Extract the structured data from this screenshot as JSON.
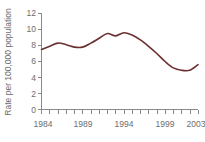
{
  "chart_data": {
    "type": "line",
    "title": "",
    "subtitle": "",
    "xlabel": "",
    "ylabel": "Rate per 100,000 population",
    "xlim": [
      1984,
      2003
    ],
    "ylim": [
      0,
      12
    ],
    "grid": false,
    "legend": false,
    "legend_position": "none",
    "line_color": "#6b3030",
    "axis_color": "#8a8a8a",
    "text_color": "#6d6d6d",
    "background_color": "#ffffff",
    "y_ticks": [
      0,
      2,
      4,
      6,
      8,
      10,
      12
    ],
    "y_tick_labels": [
      "0",
      "2",
      "4",
      "6",
      "8",
      "10",
      "12"
    ],
    "x_ticks": [
      1984,
      1985,
      1986,
      1987,
      1988,
      1989,
      1990,
      1991,
      1992,
      1993,
      1994,
      1995,
      1996,
      1997,
      1998,
      1999,
      2000,
      2001,
      2002,
      2003
    ],
    "x_tick_labels_shown": [
      "1984",
      "1989",
      "1994",
      "1999",
      "2003"
    ],
    "x_tick_labeled_values": [
      1984,
      1989,
      1994,
      1999,
      2003
    ],
    "x": [
      1984,
      1985,
      1986,
      1987,
      1988,
      1989,
      1990,
      1991,
      1992,
      1993,
      1994,
      1995,
      1996,
      1997,
      1998,
      1999,
      2000,
      2001,
      2002,
      2003
    ],
    "values": [
      7.5,
      7.9,
      8.3,
      8.1,
      7.8,
      7.8,
      8.3,
      8.9,
      9.5,
      9.2,
      9.6,
      9.3,
      8.7,
      7.9,
      7.0,
      6.0,
      5.2,
      4.9,
      4.9,
      5.6
    ],
    "series": [
      {
        "name": "Rate per 100,000 population",
        "values": [
          7.5,
          7.9,
          8.3,
          8.1,
          7.8,
          7.8,
          8.3,
          8.9,
          9.5,
          9.2,
          9.6,
          9.3,
          8.7,
          7.9,
          7.0,
          6.0,
          5.2,
          4.9,
          4.9,
          5.6
        ]
      }
    ]
  }
}
